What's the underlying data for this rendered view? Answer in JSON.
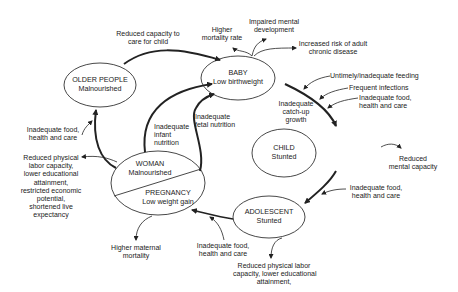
{
  "diagram": {
    "type": "cycle-diagram",
    "nodes": {
      "baby": {
        "title": "BABY",
        "subtitle": "Low birthweight"
      },
      "child": {
        "title": "CHILD",
        "subtitle": "Stunted"
      },
      "adolescent": {
        "title": "ADOLESCENT",
        "subtitle": "Stunted"
      },
      "woman": {
        "title": "WOMAN",
        "subtitle": "Malnourished"
      },
      "pregnancy": {
        "title": "PREGNANCY",
        "subtitle": "Low weight gain"
      },
      "older": {
        "title": "OLDER PEOPLE",
        "subtitle": "Malnourished"
      }
    },
    "labels": {
      "reduced_care": [
        "Reduced capacity to",
        "care for child"
      ],
      "higher_mortality": [
        "Higher",
        "mortality rate"
      ],
      "impaired_mental": [
        "Impaired mental",
        "development"
      ],
      "chronic_disease": [
        "Increased risk of adult",
        "chronic disease"
      ],
      "untimely_feeding": "Untimely/inadequate feeding",
      "frequent_infections": "Frequent infections",
      "child_food": [
        "Inadequate food,",
        "health and care"
      ],
      "catch_up": [
        "Inadequate",
        "catch-up",
        "growth"
      ],
      "reduced_mental": [
        "Reduced",
        "mental capacity"
      ],
      "adolescent_food": [
        "Inadequate food,",
        "health and care"
      ],
      "pregnancy_food": [
        "Inadequate food,",
        "health and care"
      ],
      "adolescent_outcome": [
        "Reduced physical labor",
        "capacity, lower educational",
        "attainment,"
      ],
      "maternal_mortality": [
        "Higher maternal",
        "mortality"
      ],
      "woman_outcome": [
        "Reduced physical",
        "labor capacity,",
        "lower educational",
        "attainment,",
        "restricted economic",
        "potential,",
        "shortened live",
        "expectancy"
      ],
      "older_food": [
        "Inadequate food,",
        "health and care"
      ],
      "infant_nutrition": [
        "Inadequate",
        "infant",
        "nutrition"
      ],
      "fetal_nutrition": [
        "Inadequate",
        "fetal nutrition"
      ]
    }
  }
}
